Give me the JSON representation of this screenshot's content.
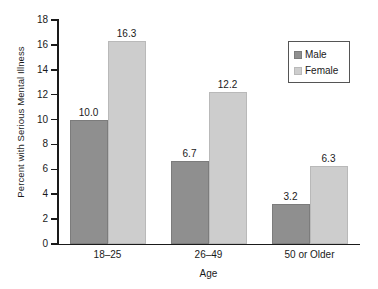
{
  "chart_data": {
    "type": "bar",
    "title": "",
    "xlabel": "Age",
    "ylabel": "Percent with Serious Mental Illness",
    "categories": [
      "18–25",
      "26–49",
      "50 or Older"
    ],
    "series": [
      {
        "name": "Male",
        "color": "#8f8f8f",
        "values": [
          10.0,
          6.7,
          3.2
        ]
      },
      {
        "name": "Female",
        "color": "#cdcdcd",
        "values": [
          16.3,
          12.2,
          6.3
        ]
      }
    ],
    "value_labels": {
      "Male": [
        "10.0",
        "6.7",
        "3.2"
      ],
      "Female": [
        "16.3",
        "12.2",
        "6.3"
      ]
    },
    "ylim": [
      0,
      18
    ],
    "yticks": [
      0,
      2,
      4,
      6,
      8,
      10,
      12,
      14,
      16,
      18
    ],
    "ytick_labels": [
      "0",
      "2",
      "4",
      "6",
      "8",
      "10",
      "12",
      "14",
      "16",
      "18"
    ],
    "grid": false,
    "legend_position": "top-right"
  }
}
